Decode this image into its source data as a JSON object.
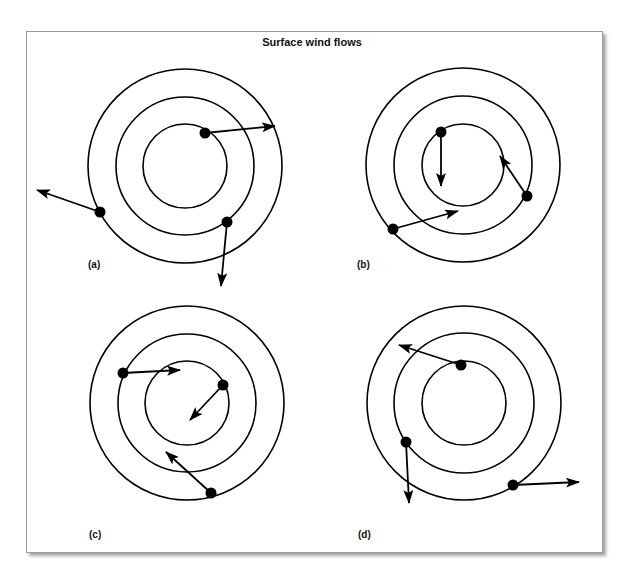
{
  "title": "Surface wind flows",
  "colors": {
    "stroke": "#000000",
    "frame_border": "#9a9a9a",
    "background": "#ffffff"
  },
  "panels": [
    {
      "label": "(a)",
      "center": [
        185,
        166
      ],
      "radii": [
        42,
        69,
        97
      ],
      "label_pos": [
        88,
        268
      ],
      "arrows": [
        {
          "from": [
            205,
            133
          ],
          "to": [
            275,
            126
          ]
        },
        {
          "from": [
            100,
            212
          ],
          "to": [
            37,
            190
          ]
        },
        {
          "from": [
            227,
            222
          ],
          "to": [
            221,
            286
          ]
        }
      ]
    },
    {
      "label": "(b)",
      "center": [
        463,
        165
      ],
      "radii": [
        41,
        69,
        97
      ],
      "label_pos": [
        357,
        268
      ],
      "arrows": [
        {
          "from": [
            441,
            132
          ],
          "to": [
            441,
            186
          ]
        },
        {
          "from": [
            527,
            196
          ],
          "to": [
            500,
            156
          ]
        },
        {
          "from": [
            393,
            229
          ],
          "to": [
            458,
            211
          ]
        }
      ]
    },
    {
      "label": "(c)",
      "center": [
        187,
        403
      ],
      "radii": [
        42,
        69,
        97
      ],
      "label_pos": [
        89,
        538
      ],
      "arrows": [
        {
          "from": [
            123,
            373
          ],
          "to": [
            180,
            370
          ]
        },
        {
          "from": [
            223,
            385
          ],
          "to": [
            190,
            420
          ]
        },
        {
          "from": [
            211,
            493
          ],
          "to": [
            166,
            452
          ]
        }
      ]
    },
    {
      "label": "(d)",
      "center": [
        464,
        403
      ],
      "radii": [
        42,
        70,
        97
      ],
      "label_pos": [
        358,
        538
      ],
      "arrows": [
        {
          "from": [
            461,
            365
          ],
          "to": [
            399,
            345
          ]
        },
        {
          "from": [
            406,
            442
          ],
          "to": [
            409,
            503
          ]
        },
        {
          "from": [
            513,
            485
          ],
          "to": [
            579,
            482
          ]
        }
      ]
    }
  ]
}
